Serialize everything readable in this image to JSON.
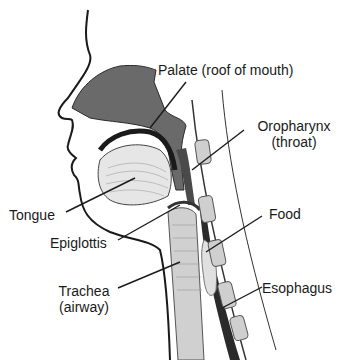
{
  "diagram": {
    "labels": {
      "palate": "Palate (roof of mouth)",
      "oropharynx_line1": "Oropharynx",
      "oropharynx_line2": "(throat)",
      "tongue": "Tongue",
      "food": "Food",
      "epiglottis": "Epiglottis",
      "trachea_line1": "Trachea",
      "trachea_line2": "(airway)",
      "esophagus": "Esophagus"
    },
    "colors": {
      "outline": "#1a1a1a",
      "tissue_dark": "#5a5a5a",
      "tissue_mid": "#8a8a8a",
      "tissue_light": "#d8d8d8",
      "background": "#ffffff"
    }
  }
}
